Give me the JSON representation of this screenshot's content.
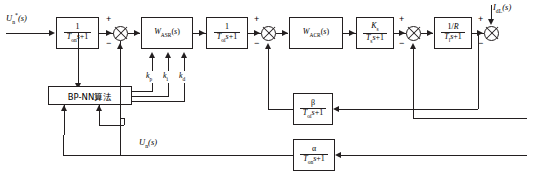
{
  "diagram": {
    "type": "control-block-diagram",
    "width": 534,
    "height": 182,
    "line_color": "#231f20",
    "background": "#ffffff"
  },
  "signals": {
    "reference_input": "U*n(s)",
    "reference_input_html": "U<sub>n</sub><sup>*</sup>(s)",
    "speed_feedback": "Un(s)",
    "speed_feedback_html": "U<sub>n</sub>(s)",
    "load_disturbance": "IdL(s)",
    "load_disturbance_html": "I<sub>dL</sub>(s)",
    "output": "n(s)",
    "output_html": "n(s)"
  },
  "blocks": [
    {
      "id": "input-filter",
      "name": "input-filter-block",
      "numerator": "1",
      "denominator": "Ton s+1",
      "denominator_html": "T<sub>on</sub>s+1"
    },
    {
      "id": "asr",
      "name": "speed-regulator-block",
      "label": "W ASR (s)",
      "label_html": "W<sub>ASR</sub>(s)"
    },
    {
      "id": "current-filter",
      "name": "current-filter-block",
      "numerator": "1",
      "denominator": "Toi s+1",
      "denominator_html": "T<sub>oi</sub>s+1"
    },
    {
      "id": "acr",
      "name": "current-regulator-block",
      "label": "W ACR (s)",
      "label_html": "W<sub>ACR</sub>(s)"
    },
    {
      "id": "converter",
      "name": "power-converter-block",
      "numerator": "Ks",
      "numerator_html": "K<sub>s</sub>",
      "denominator": "Ts s+1",
      "denominator_html": "T<sub>s</sub>s+1"
    },
    {
      "id": "armature",
      "name": "armature-circuit-block",
      "numerator": "1/R",
      "numerator_html": "1/R",
      "denominator": "Tl s+1",
      "denominator_html": "T<sub>l</sub>s+1"
    },
    {
      "id": "mechanical",
      "name": "mechanical-inertia-block",
      "numerator": "R",
      "numerator_html": "R",
      "denominator": "Tm s",
      "denominator_html": "T<sub>m</sub>s"
    },
    {
      "id": "emf",
      "name": "back-emf-constant-block",
      "numerator": "1",
      "denominator": "Ce",
      "denominator_html": "C<sub>e</sub>"
    },
    {
      "id": "current-feedback",
      "name": "current-feedback-block",
      "numerator": "beta",
      "numerator_html": "&beta;",
      "denominator": "Toi s+1",
      "denominator_html": "T<sub>oi</sub>s+1"
    },
    {
      "id": "speed-feedback",
      "name": "speed-feedback-block",
      "numerator": "alpha",
      "numerator_html": "&alpha;",
      "denominator": "Ton s+1",
      "denominator_html": "T<sub>on</sub>s+1"
    },
    {
      "id": "bpnn",
      "name": "bp-neural-network-block",
      "label": "BP-NN算法"
    }
  ],
  "gains": [
    {
      "id": "kp",
      "label": "kp",
      "label_html": "k<sub>p</sub>"
    },
    {
      "id": "ki",
      "label": "ki",
      "label_html": "k<sub>i</sub>"
    },
    {
      "id": "kd",
      "label": "kd",
      "label_html": "k<sub>d</sub>"
    }
  ],
  "summing_junctions": [
    {
      "id": "sum-speed",
      "name": "speed-error-summing-junction",
      "plus": "+",
      "minus": "−"
    },
    {
      "id": "sum-current",
      "name": "current-error-summing-junction",
      "plus": "+",
      "minus": "−"
    },
    {
      "id": "sum-emf",
      "name": "back-emf-summing-junction",
      "plus": "+",
      "minus": "−"
    },
    {
      "id": "sum-load",
      "name": "load-disturbance-summing-junction",
      "plus": "+",
      "minus": "−"
    }
  ]
}
